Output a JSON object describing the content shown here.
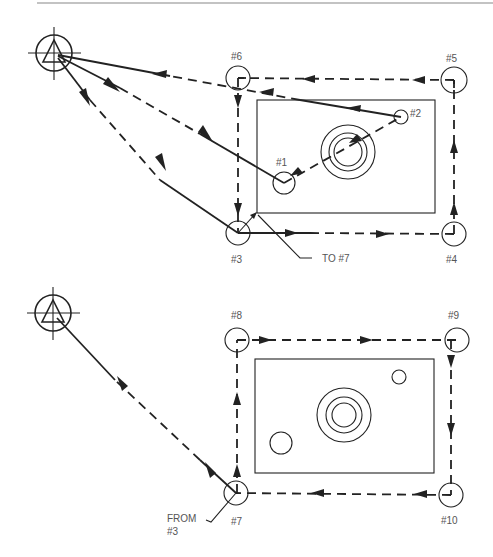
{
  "figure": {
    "type": "cnc-tool-path-diagram",
    "upper_view": {
      "points": [
        {
          "id": "p1",
          "label": "#1"
        },
        {
          "id": "p2",
          "label": "#2"
        },
        {
          "id": "p3",
          "label": "#3"
        },
        {
          "id": "p4",
          "label": "#4"
        },
        {
          "id": "p5",
          "label": "#5"
        },
        {
          "id": "p6",
          "label": "#6"
        }
      ],
      "callout": "TO #7"
    },
    "lower_view": {
      "points": [
        {
          "id": "p7",
          "label": "#7"
        },
        {
          "id": "p8",
          "label": "#8"
        },
        {
          "id": "p9",
          "label": "#9"
        },
        {
          "id": "p10",
          "label": "#10"
        }
      ],
      "callout_line1": "FROM",
      "callout_line2": "#3"
    },
    "colors": {
      "line": "#222222",
      "label": "#555555",
      "background": "#ffffff"
    }
  }
}
